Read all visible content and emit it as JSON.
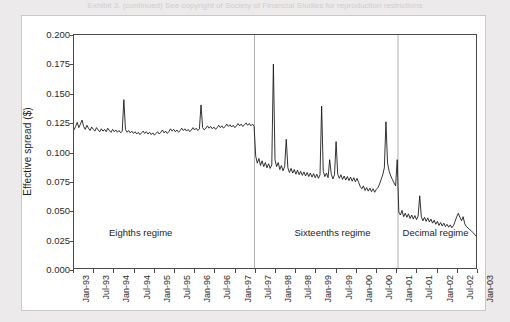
{
  "page": {
    "caption_strip": "Exhibit 3. (continued)  See copyright of Society of Financial Studies for reproduction restrictions"
  },
  "chart_data": {
    "type": "line",
    "title": "",
    "xlabel": "",
    "ylabel": "Effective spread ($)",
    "ylim": [
      0.0,
      0.2
    ],
    "yticks": [
      0.0,
      0.025,
      0.05,
      0.075,
      0.1,
      0.125,
      0.15,
      0.175,
      0.2
    ],
    "ytick_labels": [
      "0.000",
      "0.025",
      "0.050",
      "0.075",
      "0.100",
      "0.125",
      "0.150",
      "0.175",
      "0.200"
    ],
    "grid": false,
    "legend": "none",
    "xlim": [
      "Jan-93",
      "Jan-03"
    ],
    "xtick_labels": [
      "Jan-93",
      "Jul-93",
      "Jan-94",
      "Jul-94",
      "Jan-95",
      "Jul-95",
      "Jan-96",
      "Jul-96",
      "Jan-97",
      "Jul-97",
      "Jan-98",
      "Jul-98",
      "Jan-99",
      "Jul-99",
      "Jan-00",
      "Jul-00",
      "Jan-01",
      "Jul-01",
      "Jan-02",
      "Jul-02",
      "Jan-03"
    ],
    "annotations": [
      {
        "text": "Eighths regime",
        "x_fraction": 0.165,
        "y_value": 0.0315
      },
      {
        "text": "Sixteenths regime",
        "x_fraction": 0.64,
        "y_value": 0.0315
      },
      {
        "text": "Decimal regime",
        "x_fraction": 0.895,
        "y_value": 0.0315
      }
    ],
    "regime_breaks": [
      {
        "label": "eighths-to-sixteenths",
        "x_fraction": 0.449
      },
      {
        "label": "sixteenths-to-decimal",
        "x_fraction": 0.806
      }
    ],
    "series": [
      {
        "name": "Effective spread",
        "color": "#1a1a1a",
        "x": [
          0.0,
          0.004,
          0.008,
          0.012,
          0.016,
          0.02,
          0.024,
          0.028,
          0.032,
          0.036,
          0.04,
          0.044,
          0.048,
          0.052,
          0.056,
          0.06,
          0.064,
          0.068,
          0.072,
          0.076,
          0.08,
          0.084,
          0.088,
          0.092,
          0.096,
          0.1,
          0.104,
          0.108,
          0.112,
          0.116,
          0.12,
          0.124,
          0.128,
          0.132,
          0.136,
          0.14,
          0.144,
          0.148,
          0.152,
          0.156,
          0.16,
          0.164,
          0.168,
          0.172,
          0.176,
          0.18,
          0.184,
          0.188,
          0.192,
          0.196,
          0.2,
          0.204,
          0.208,
          0.212,
          0.216,
          0.22,
          0.224,
          0.228,
          0.232,
          0.236,
          0.24,
          0.244,
          0.248,
          0.252,
          0.256,
          0.26,
          0.264,
          0.268,
          0.272,
          0.276,
          0.28,
          0.284,
          0.288,
          0.292,
          0.296,
          0.3,
          0.304,
          0.308,
          0.312,
          0.316,
          0.32,
          0.324,
          0.328,
          0.332,
          0.336,
          0.34,
          0.344,
          0.348,
          0.352,
          0.356,
          0.36,
          0.364,
          0.368,
          0.372,
          0.376,
          0.38,
          0.384,
          0.388,
          0.392,
          0.396,
          0.4,
          0.404,
          0.408,
          0.412,
          0.416,
          0.42,
          0.424,
          0.428,
          0.432,
          0.436,
          0.44,
          0.444,
          0.448,
          0.452,
          0.456,
          0.46,
          0.464,
          0.468,
          0.472,
          0.476,
          0.48,
          0.484,
          0.488,
          0.492,
          0.496,
          0.5,
          0.504,
          0.508,
          0.512,
          0.516,
          0.52,
          0.524,
          0.528,
          0.532,
          0.536,
          0.54,
          0.544,
          0.548,
          0.552,
          0.556,
          0.56,
          0.564,
          0.568,
          0.572,
          0.576,
          0.58,
          0.584,
          0.588,
          0.592,
          0.596,
          0.6,
          0.604,
          0.608,
          0.612,
          0.616,
          0.62,
          0.624,
          0.628,
          0.632,
          0.636,
          0.64,
          0.644,
          0.648,
          0.652,
          0.656,
          0.66,
          0.664,
          0.668,
          0.672,
          0.676,
          0.68,
          0.684,
          0.688,
          0.692,
          0.696,
          0.7,
          0.704,
          0.708,
          0.712,
          0.716,
          0.72,
          0.724,
          0.728,
          0.732,
          0.736,
          0.74,
          0.744,
          0.748,
          0.752,
          0.756,
          0.76,
          0.764,
          0.768,
          0.772,
          0.776,
          0.78,
          0.784,
          0.788,
          0.792,
          0.796,
          0.8,
          0.804,
          0.808,
          0.812,
          0.816,
          0.82,
          0.824,
          0.828,
          0.832,
          0.836,
          0.84,
          0.844,
          0.848,
          0.852,
          0.856,
          0.86,
          0.864,
          0.868,
          0.872,
          0.876,
          0.88,
          0.884,
          0.888,
          0.892,
          0.896,
          0.9,
          0.904,
          0.908,
          0.912,
          0.916,
          0.92,
          0.924,
          0.928,
          0.932,
          0.936,
          0.94,
          0.944,
          0.948,
          0.952,
          0.956,
          0.96,
          0.964,
          0.968,
          0.972,
          0.976,
          0.98,
          0.984,
          0.988,
          0.992,
          0.996,
          1.0
        ],
        "y": [
          0.1185,
          0.1215,
          0.125,
          0.1205,
          0.1235,
          0.127,
          0.1215,
          0.119,
          0.1225,
          0.12,
          0.118,
          0.121,
          0.119,
          0.1175,
          0.1205,
          0.1185,
          0.117,
          0.1195,
          0.1175,
          0.119,
          0.117,
          0.12,
          0.118,
          0.1165,
          0.119,
          0.117,
          0.1185,
          0.1165,
          0.118,
          0.116,
          0.1175,
          0.1445,
          0.119,
          0.1165,
          0.118,
          0.116,
          0.1175,
          0.1155,
          0.117,
          0.115,
          0.1165,
          0.1145,
          0.116,
          0.1175,
          0.1155,
          0.117,
          0.115,
          0.1165,
          0.1145,
          0.116,
          0.114,
          0.1155,
          0.117,
          0.115,
          0.1165,
          0.1185,
          0.116,
          0.1175,
          0.1155,
          0.117,
          0.1195,
          0.1175,
          0.119,
          0.117,
          0.1185,
          0.1165,
          0.118,
          0.12,
          0.118,
          0.1195,
          0.1175,
          0.119,
          0.117,
          0.1185,
          0.1205,
          0.1185,
          0.12,
          0.118,
          0.1195,
          0.14,
          0.1205,
          0.1185,
          0.12,
          0.122,
          0.12,
          0.1215,
          0.1195,
          0.121,
          0.119,
          0.1205,
          0.1225,
          0.1205,
          0.122,
          0.12,
          0.1215,
          0.1235,
          0.1215,
          0.123,
          0.121,
          0.1225,
          0.1205,
          0.122,
          0.124,
          0.122,
          0.1235,
          0.1215,
          0.123,
          0.1245,
          0.1225,
          0.124,
          0.122,
          0.1235,
          0.1215,
          0.096,
          0.09,
          0.094,
          0.088,
          0.092,
          0.087,
          0.0905,
          0.086,
          0.0895,
          0.0855,
          0.0885,
          0.175,
          0.093,
          0.087,
          0.0905,
          0.0845,
          0.088,
          0.0835,
          0.087,
          0.1105,
          0.086,
          0.082,
          0.0855,
          0.0815,
          0.0845,
          0.0805,
          0.084,
          0.08,
          0.083,
          0.0795,
          0.0825,
          0.079,
          0.082,
          0.0785,
          0.0815,
          0.078,
          0.081,
          0.0775,
          0.0805,
          0.077,
          0.08,
          0.139,
          0.083,
          0.0785,
          0.0815,
          0.0775,
          0.093,
          0.0805,
          0.0765,
          0.08,
          0.1085,
          0.0805,
          0.077,
          0.08,
          0.076,
          0.079,
          0.0755,
          0.0785,
          0.075,
          0.078,
          0.0745,
          0.0775,
          0.074,
          0.077,
          0.0735,
          0.07,
          0.068,
          0.0705,
          0.0665,
          0.069,
          0.066,
          0.0685,
          0.0655,
          0.068,
          0.065,
          0.0675,
          0.069,
          0.072,
          0.076,
          0.08,
          0.086,
          0.1255,
          0.09,
          0.083,
          0.079,
          0.076,
          0.073,
          0.0705,
          0.093,
          0.048,
          0.0455,
          0.0495,
          0.044,
          0.047,
          0.0435,
          0.0465,
          0.0425,
          0.0455,
          0.042,
          0.045,
          0.0415,
          0.0445,
          0.062,
          0.044,
          0.0405,
          0.0435,
          0.04,
          0.043,
          0.0395,
          0.042,
          0.0385,
          0.041,
          0.0375,
          0.04,
          0.0365,
          0.039,
          0.036,
          0.0385,
          0.0355,
          0.0375,
          0.035,
          0.037,
          0.0345,
          0.0365,
          0.04,
          0.044,
          0.047,
          0.0435,
          0.0405,
          0.044,
          0.038,
          0.0355,
          0.0345,
          0.033,
          0.032,
          0.0305,
          0.029,
          0.0275
        ]
      }
    ]
  }
}
